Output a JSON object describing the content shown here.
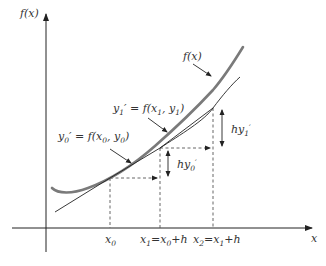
{
  "diagram": {
    "colors": {
      "axis": "#222222",
      "true_curve": "#7a7a7a",
      "euler_path": "#222222",
      "dashed": "#555555",
      "text": "#333333"
    },
    "axes": {
      "y_label": "f(x)",
      "x_label": "x"
    },
    "curve_label": "f(x)",
    "slope_labels": {
      "y0_prime_lhs": "y",
      "y0_prime_sub": "0",
      "y0_prime_rhs": "′ = f(x",
      "y0_prime_args_sub": "0",
      "y0_prime_args_rest": ", y",
      "y0_prime_args_sub2": "0",
      "y0_prime_close": ")",
      "y1_prime_lhs": "y",
      "y1_prime_sub": "1",
      "y1_prime_rhs": "′ = f(x",
      "y1_prime_args_sub": "1",
      "y1_prime_args_rest": ", y",
      "y1_prime_args_sub2": "1",
      "y1_prime_close": ")"
    },
    "increment_labels": {
      "hy0": {
        "main": "hy",
        "sub": "0",
        "prime": "′"
      },
      "hy1": {
        "main": "hy",
        "sub": "1",
        "prime": "′"
      }
    },
    "x_ticks": [
      {
        "main": "x",
        "sub": "0",
        "rest": ""
      },
      {
        "main": "x",
        "sub": "1",
        "rest": "=x",
        "sub2": "0",
        "rest2": "+h"
      },
      {
        "main": "x",
        "sub": "2",
        "rest": "=x",
        "sub2": "1",
        "rest2": "+h"
      }
    ]
  }
}
